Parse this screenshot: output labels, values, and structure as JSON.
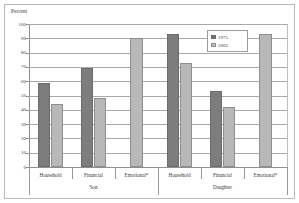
{
  "chart_data": {
    "type": "bar",
    "title": "",
    "subtitle": "",
    "ylabel": "Percent",
    "xlabel": "",
    "ylim": [
      0,
      100
    ],
    "ytick_step": 10,
    "yticks": [
      "100",
      "90",
      "80",
      "70",
      "60",
      "50",
      "40",
      "30",
      "20",
      "10",
      "0"
    ],
    "grid": true,
    "legend_position": "top-right",
    "categories": [
      "Household",
      "Financial",
      "Emotional*",
      "Household",
      "Financial",
      "Emotional*"
    ],
    "groups": [
      {
        "name": "Son",
        "categories": [
          "Household",
          "Financial",
          "Emotional*"
        ]
      },
      {
        "name": "Daughter",
        "categories": [
          "Household",
          "Financial",
          "Emotional*"
        ]
      }
    ],
    "series": [
      {
        "name": "1975",
        "color": "#7d7d7d",
        "values": [
          59,
          69,
          null,
          93,
          53,
          null
        ]
      },
      {
        "name": "2002",
        "color": "#b8b8b8",
        "values": [
          44,
          48,
          90,
          73,
          42,
          93
        ]
      }
    ]
  },
  "legend": {
    "entries": [
      {
        "label": "1975"
      },
      {
        "label": "2002"
      }
    ]
  }
}
